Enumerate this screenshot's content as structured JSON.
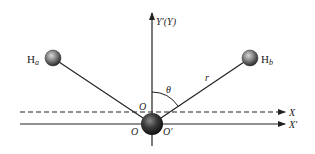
{
  "diagram": {
    "type": "molecular-coordinate-geometry",
    "axes": {
      "y_label": "Y′(Y)",
      "x_label": "X",
      "x_prime_label": "X′"
    },
    "origins": {
      "o_upper": "O",
      "o_lower": "O",
      "o_prime": "O′"
    },
    "atoms": {
      "left": {
        "label": "H",
        "subscript": "a"
      },
      "right": {
        "label": "H",
        "subscript": "b"
      }
    },
    "annotations": {
      "angle": "θ",
      "distance": "r"
    }
  }
}
